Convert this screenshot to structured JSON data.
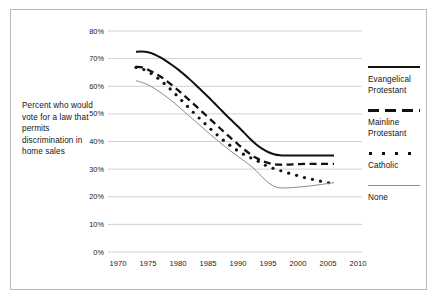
{
  "figure": {
    "caption": "Percent who would vote for a law that permits discrimination in home sales",
    "border_color": "#b9b9b9",
    "background": "#ffffff"
  },
  "legend": {
    "position": "right",
    "entries": [
      {
        "label": "Evangelical Protestant",
        "style": "solid-thick",
        "color": "#111111",
        "swatch": "legend-swatch-evangelical"
      },
      {
        "label": "Mainline Protestant",
        "style": "dashed-thick",
        "color": "#111111",
        "swatch": "legend-swatch-mainline"
      },
      {
        "label": "Catholic",
        "style": "dotted",
        "color": "#111111",
        "swatch": "legend-swatch-catholic"
      },
      {
        "label": "None",
        "style": "solid-thin",
        "color": "#8e8e8e",
        "swatch": "legend-swatch-none"
      }
    ]
  },
  "chart_data": {
    "type": "line",
    "title": "",
    "xlabel": "",
    "ylabel": "Percent who would vote for a law that permits discrimination in home sales",
    "xlim": [
      1970,
      2010
    ],
    "ylim": [
      0,
      80
    ],
    "xticks": [
      1970,
      1975,
      1980,
      1985,
      1990,
      1995,
      2000,
      2005,
      2010
    ],
    "xtick_labels": [
      "1970",
      "1975",
      "1980",
      "1985",
      "1990",
      "1995",
      "2000",
      "2005",
      "2010"
    ],
    "yticks": [
      0,
      10,
      20,
      30,
      40,
      50,
      60,
      70,
      80
    ],
    "ytick_labels": [
      "0%",
      "10%",
      "20%",
      "30%",
      "40%",
      "50%",
      "60%",
      "70%",
      "80%"
    ],
    "grid": "horizontal",
    "legend_position": "right",
    "series": [
      {
        "name": "Evangelical Protestant",
        "style": "solid-thick",
        "color": "#111111",
        "x": [
          1973,
          1974,
          1975,
          1976,
          1977,
          1978,
          1979,
          1980,
          1981,
          1982,
          1983,
          1984,
          1985,
          1986,
          1987,
          1988,
          1989,
          1990,
          1991,
          1992,
          1993,
          1994,
          1995,
          1996,
          1997,
          1998,
          1999,
          2000,
          2001,
          2002,
          2003,
          2004,
          2005,
          2006
        ],
        "values": [
          72.5,
          72.6,
          72.3,
          71.6,
          70.5,
          69.2,
          67.7,
          66.1,
          64.3,
          62.4,
          60.4,
          58.3,
          56.2,
          54.0,
          51.8,
          49.6,
          47.5,
          45.4,
          43.2,
          41.0,
          39.0,
          37.4,
          36.2,
          35.4,
          35.0,
          34.9,
          34.9,
          34.9,
          34.9,
          34.9,
          34.9,
          34.9,
          34.9,
          34.9
        ]
      },
      {
        "name": "Mainline Protestant",
        "style": "dashed-thick",
        "color": "#111111",
        "x": [
          1973,
          1974,
          1975,
          1976,
          1977,
          1978,
          1979,
          1980,
          1981,
          1982,
          1983,
          1984,
          1985,
          1986,
          1987,
          1988,
          1989,
          1990,
          1991,
          1992,
          1993,
          1994,
          1995,
          1996,
          1997,
          1998,
          1999,
          2000,
          2001,
          2002,
          2003,
          2004,
          2005,
          2006
        ],
        "values": [
          67.0,
          66.8,
          66.0,
          64.9,
          63.6,
          62.1,
          60.4,
          58.6,
          56.7,
          54.8,
          52.8,
          50.8,
          48.8,
          46.8,
          44.8,
          42.8,
          40.9,
          39.0,
          37.2,
          35.5,
          34.1,
          33.0,
          32.3,
          31.8,
          31.6,
          31.6,
          31.7,
          31.8,
          31.9,
          31.9,
          31.9,
          31.9,
          31.9,
          31.9
        ]
      },
      {
        "name": "Catholic",
        "style": "dotted",
        "color": "#111111",
        "x": [
          1973,
          1974,
          1975,
          1976,
          1977,
          1978,
          1979,
          1980,
          1981,
          1982,
          1983,
          1984,
          1985,
          1986,
          1987,
          1988,
          1989,
          1990,
          1991,
          1992,
          1993,
          1994,
          1995,
          1996,
          1997,
          1998,
          1999,
          2000,
          2001,
          2002,
          2003,
          2004,
          2005,
          2006
        ],
        "values": [
          66.8,
          66.3,
          65.3,
          63.9,
          62.3,
          60.4,
          58.4,
          56.2,
          54.0,
          51.8,
          49.6,
          47.5,
          45.4,
          43.4,
          41.5,
          39.7,
          38.1,
          36.6,
          35.3,
          34.2,
          33.3,
          32.0,
          31.0,
          30.2,
          29.5,
          28.8,
          28.2,
          27.6,
          27.0,
          26.5,
          26.0,
          25.5,
          25.1,
          24.8
        ]
      },
      {
        "name": "None",
        "style": "solid-thin",
        "color": "#8e8e8e",
        "x": [
          1973,
          1974,
          1975,
          1976,
          1977,
          1978,
          1979,
          1980,
          1981,
          1982,
          1983,
          1984,
          1985,
          1986,
          1987,
          1988,
          1989,
          1990,
          1991,
          1992,
          1993,
          1994,
          1995,
          1996,
          1997,
          1998,
          1999,
          2000,
          2001,
          2002,
          2003,
          2004,
          2005,
          2006
        ],
        "values": [
          62.0,
          61.4,
          60.5,
          59.3,
          57.9,
          56.3,
          54.6,
          52.8,
          50.9,
          49.0,
          47.1,
          45.2,
          43.3,
          41.4,
          39.6,
          37.9,
          36.2,
          34.6,
          33.0,
          31.4,
          29.5,
          27.2,
          25.2,
          23.8,
          23.2,
          23.2,
          23.3,
          23.5,
          23.7,
          23.9,
          24.2,
          24.5,
          24.8,
          25.1
        ]
      }
    ]
  }
}
